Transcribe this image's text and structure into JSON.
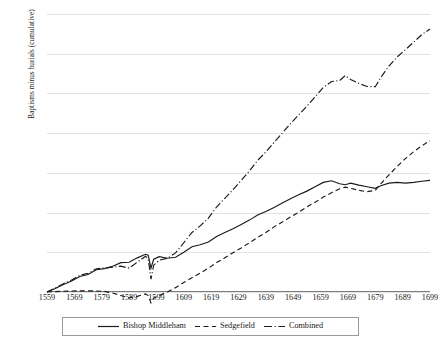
{
  "chart_data": {
    "type": "line",
    "title": "",
    "xlabel": "",
    "ylabel": "Baptisms minus burials (cumulative)",
    "xlim": [
      1559,
      1699
    ],
    "ylim": [
      0,
      1400
    ],
    "yticks": [
      0,
      200,
      400,
      600,
      800,
      1000,
      1200,
      1400
    ],
    "xticks": [
      1559,
      1569,
      1579,
      1589,
      1599,
      1609,
      1619,
      1629,
      1639,
      1649,
      1659,
      1669,
      1679,
      1689,
      1699
    ],
    "grid": "horizontal",
    "legend_position": "bottom",
    "x": [
      1559,
      1562,
      1565,
      1568,
      1571,
      1574,
      1577,
      1580,
      1583,
      1586,
      1589,
      1592,
      1595,
      1596,
      1597,
      1598,
      1600,
      1603,
      1606,
      1609,
      1612,
      1615,
      1618,
      1621,
      1624,
      1627,
      1630,
      1633,
      1636,
      1639,
      1642,
      1645,
      1648,
      1651,
      1654,
      1657,
      1660,
      1663,
      1666,
      1668,
      1670,
      1673,
      1676,
      1679,
      1681,
      1684,
      1687,
      1690,
      1693,
      1696,
      1699
    ],
    "series": [
      {
        "name": "Bishop Middleham",
        "style": "solid",
        "values": [
          0,
          18,
          38,
          55,
          78,
          88,
          112,
          118,
          130,
          148,
          150,
          172,
          190,
          185,
          120,
          165,
          178,
          170,
          175,
          200,
          228,
          238,
          252,
          280,
          300,
          318,
          340,
          362,
          388,
          405,
          425,
          448,
          470,
          490,
          508,
          530,
          552,
          560,
          545,
          540,
          548,
          538,
          530,
          522,
          535,
          548,
          552,
          548,
          552,
          558,
          562
        ]
      },
      {
        "name": "Sedgefield",
        "style": "dashed",
        "values": [
          0,
          2,
          4,
          5,
          6,
          6,
          5,
          3,
          -5,
          -18,
          -30,
          -22,
          -10,
          -18,
          -55,
          -30,
          -18,
          0,
          22,
          48,
          72,
          95,
          120,
          148,
          172,
          198,
          222,
          248,
          275,
          300,
          328,
          352,
          378,
          402,
          428,
          452,
          478,
          500,
          520,
          528,
          522,
          512,
          505,
          512,
          545,
          590,
          632,
          672,
          706,
          736,
          762
        ]
      },
      {
        "name": "Combined",
        "style": "dash-dot",
        "values": [
          0,
          20,
          42,
          60,
          84,
          94,
          117,
          121,
          125,
          130,
          120,
          150,
          180,
          167,
          65,
          135,
          160,
          170,
          197,
          248,
          300,
          333,
          372,
          428,
          472,
          516,
          562,
          610,
          663,
          705,
          753,
          800,
          848,
          892,
          936,
          982,
          1030,
          1060,
          1065,
          1090,
          1070,
          1050,
          1035,
          1034,
          1080,
          1138,
          1184,
          1220,
          1258,
          1296,
          1324
        ]
      }
    ]
  },
  "legend": {
    "items": [
      {
        "label": "Bishop Middleham",
        "key": "solid-line-key"
      },
      {
        "label": "Sedgefield",
        "key": "dashed-line-key"
      },
      {
        "label": "Combined",
        "key": "dash-dot-line-key"
      }
    ]
  },
  "colors": {
    "line": "#1a1a1a",
    "grid": "#e2e2e2",
    "axis": "#7d7d7d",
    "background": "#ffffff"
  }
}
